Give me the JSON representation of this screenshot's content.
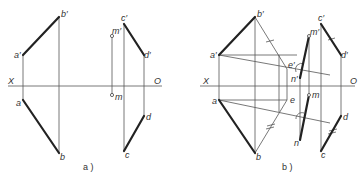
{
  "figure_a": {
    "caption": "a )",
    "axis": {
      "left_label": "X",
      "right_label": "O"
    },
    "labels": {
      "a_prime": "a′",
      "b_prime": "b′",
      "a": "a",
      "b": "b",
      "m_prime": "m′",
      "m": "m",
      "c_prime": "c′",
      "d_prime": "d′",
      "c": "c",
      "d": "d"
    }
  },
  "figure_b": {
    "caption": "b )",
    "axis": {
      "left_label": "X",
      "right_label": "O"
    },
    "labels": {
      "a_prime": "a′",
      "b_prime": "b′",
      "a": "a",
      "b": "b",
      "e_prime": "e′",
      "e": "e",
      "m_prime": "m′",
      "m": "m",
      "n_prime": "n′",
      "n": "n",
      "c_prime": "c′",
      "d_prime": "d′",
      "c": "c",
      "d": "d"
    }
  }
}
